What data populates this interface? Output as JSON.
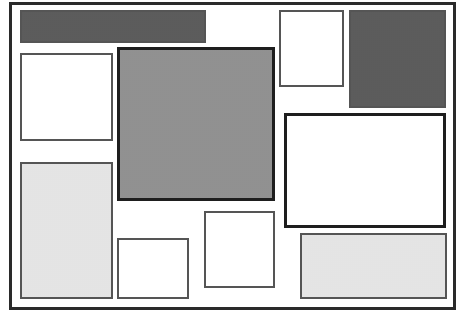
{
  "diagram": {
    "type": "page-layout-wireframe",
    "frame": {
      "x": 9,
      "y": 2,
      "w": 447,
      "h": 308,
      "fill": "white",
      "border": "thick"
    },
    "blocks": [
      {
        "id": "top-bar",
        "x": 20,
        "y": 10,
        "w": 186,
        "h": 33,
        "fill": "dark",
        "border": "normal"
      },
      {
        "id": "left-white-box",
        "x": 20,
        "y": 53,
        "w": 93,
        "h": 88,
        "fill": "white",
        "border": "normal"
      },
      {
        "id": "center-large-box",
        "x": 117,
        "y": 47,
        "w": 158,
        "h": 154,
        "fill": "medium",
        "border": "thick"
      },
      {
        "id": "top-right-white-box",
        "x": 279,
        "y": 10,
        "w": 65,
        "h": 77,
        "fill": "white",
        "border": "normal"
      },
      {
        "id": "top-right-dark-box",
        "x": 349,
        "y": 10,
        "w": 97,
        "h": 98,
        "fill": "dark",
        "border": "normal"
      },
      {
        "id": "right-white-thick-box",
        "x": 284,
        "y": 113,
        "w": 162,
        "h": 115,
        "fill": "white",
        "border": "thick"
      },
      {
        "id": "left-tall-light-box",
        "x": 20,
        "y": 162,
        "w": 93,
        "h": 137,
        "fill": "light",
        "border": "normal"
      },
      {
        "id": "bottom-small-white-box",
        "x": 117,
        "y": 238,
        "w": 72,
        "h": 61,
        "fill": "white",
        "border": "normal"
      },
      {
        "id": "middle-bottom-white-box",
        "x": 204,
        "y": 211,
        "w": 71,
        "h": 77,
        "fill": "white",
        "border": "normal"
      },
      {
        "id": "bottom-right-light-box",
        "x": 300,
        "y": 233,
        "w": 147,
        "h": 66,
        "fill": "light",
        "border": "normal"
      }
    ]
  }
}
